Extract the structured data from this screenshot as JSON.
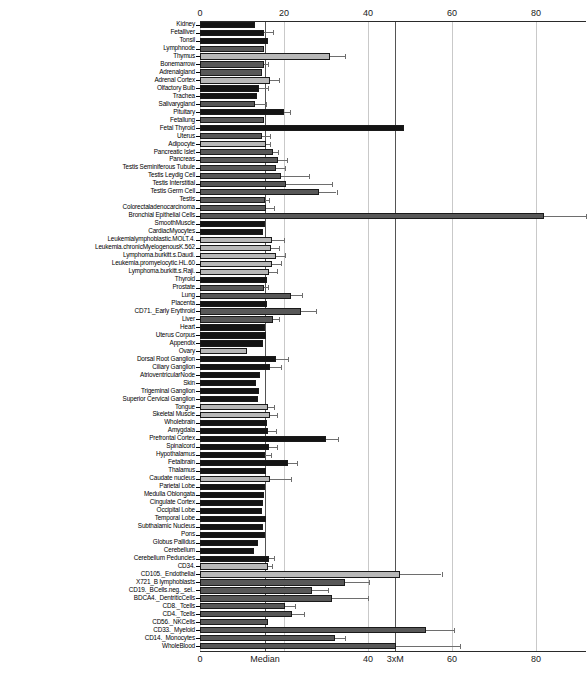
{
  "chart_data": {
    "type": "bar",
    "title": "",
    "subtitle": "",
    "xlabel": "",
    "ylabel": "",
    "orientation": "horizontal",
    "xlim": [
      0,
      90
    ],
    "grid": true,
    "legend": null,
    "axis_ticks_top": [
      {
        "label": "0",
        "value": 0
      },
      {
        "label": "20",
        "value": 20
      },
      {
        "label": "40",
        "value": 40
      },
      {
        "label": "60",
        "value": 60
      },
      {
        "label": "80",
        "value": 80
      }
    ],
    "axis_ticks_bottom": [
      {
        "label": "0",
        "value": 0
      },
      {
        "label": "Median",
        "value": 15.5
      },
      {
        "label": "40",
        "value": 40
      },
      {
        "label": "3xM",
        "value": 46.5
      },
      {
        "label": "60",
        "value": 60
      },
      {
        "label": "80",
        "value": 80
      }
    ],
    "reference_lines": [
      {
        "label": "Median",
        "value": 15.5
      },
      {
        "label": "3xM",
        "value": 46.5
      }
    ],
    "categories": [
      "Kidney",
      "Fetalliver",
      "Tonsil",
      "Lymphnode",
      "Thymus",
      "Bonemarrow",
      "Adrenalgland",
      "Adrenal Cortex",
      "Olfactory Bulb",
      "Trachea",
      "Salivarygland",
      "Pituitary",
      "Fetallung",
      "Fetal Thyroid",
      "Uterus",
      "Adipocyte",
      "Pancreatic Islet",
      "Pancreas",
      "Testis Seminiferous Tubule",
      "Testis Leydig Cell",
      "Testis Interstitial",
      "Testis Germ Cell",
      "Testis",
      "Colorectaladenocarcinoma",
      "Bronchial Epithelial Cells",
      "SmoothMuscle",
      "CardiacMyocytes",
      "Leukemialymphoblastic.MOLT.4.",
      "Leukemia.chronicMyelogenousK.562",
      "Lymphoma.burkitt.s.Daudi.",
      "Leukemia.promyelocytic.HL.60",
      "Lymphoma.burkitt.s.Raji.",
      "Thyroid",
      "Prostate",
      "Lung",
      "Placenta",
      "CD71._Early Erythroid",
      "Liver",
      "Heart",
      "Uterus Corpus",
      "Appendix",
      "Ovary",
      "Dorsal Root Ganglion",
      "Ciliary Ganglion",
      "AtrioventricularNode",
      "Skin",
      "Trigeminal Ganglion",
      "Superior Cervical Ganglion",
      "Tongue",
      "Skeletal Muscle",
      "Wholebrain",
      "Amygdala",
      "Prefrontal Cortex",
      "Spinalcord",
      "Hypothalamus",
      "Fetalbrain",
      "Thalamus",
      "Caudate nucleus",
      "Parietal Lobe",
      "Medulla Oblongata",
      "Cingulate Cortex",
      "Occipital Lobe",
      "Temporal Lobe",
      "Subthalamic Nucleus",
      "Pons",
      "Globus Pallidus",
      "Cerebellum",
      "Cerebellum Peduncles",
      "CD34.",
      "CD105._Endothelial",
      "X721_B lymphoblasts",
      "CD19._BCells.neg._sel..",
      "BDCA4._DentriticCells",
      "CD8._Tcells",
      "CD4._Tcells",
      "CD56._NKCells",
      "CD33._Myeloid",
      "CD14._Monocytes",
      "WholeBlood"
    ],
    "values": [
      13.2,
      15.3,
      16.3,
      15.2,
      31.0,
      15.2,
      14.8,
      16.6,
      14.1,
      13.6,
      13.0,
      19.9,
      15.2,
      48.5,
      14.8,
      15.6,
      17.3,
      18.6,
      18.1,
      19.4,
      20.5,
      28.4,
      15.5,
      15.6,
      82.0,
      15.5,
      14.9,
      17.2,
      16.9,
      18.2,
      17.2,
      16.4,
      16.0,
      15.2,
      21.7,
      16.0,
      24.0,
      17.4,
      15.4,
      15.6,
      15.0,
      11.2,
      18.0,
      16.7,
      14.3,
      13.3,
      14.0,
      13.8,
      16.2,
      16.6,
      16.0,
      16.2,
      29.9,
      16.4,
      15.4,
      20.9,
      15.8,
      16.6,
      15.4,
      15.3,
      15.0,
      14.7,
      15.6,
      14.9,
      15.4,
      13.9,
      12.8,
      16.4,
      16.1,
      47.6,
      34.6,
      26.6,
      31.4,
      20.3,
      21.9,
      16.1,
      53.8,
      32.2,
      46.6
    ],
    "errors_upper": [
      0.0,
      17.3,
      0.0,
      0.0,
      34.5,
      16.3,
      0.0,
      18.8,
      16.3,
      0.0,
      15.6,
      21.5,
      0.0,
      0.0,
      16.6,
      16.6,
      18.6,
      20.6,
      20.3,
      26.0,
      31.5,
      32.5,
      16.4,
      17.6,
      92.0,
      0.0,
      0.0,
      19.9,
      18.8,
      20.3,
      19.4,
      18.4,
      0.0,
      16.3,
      24.2,
      0.0,
      27.7,
      18.8,
      0.0,
      0.0,
      0.0,
      0.0,
      21.0,
      19.4,
      0.0,
      0.0,
      0.0,
      0.0,
      17.6,
      18.4,
      0.0,
      18.2,
      32.8,
      18.4,
      16.8,
      23.2,
      0.0,
      21.7,
      0.0,
      0.0,
      0.0,
      0.0,
      0.0,
      0.0,
      0.0,
      0.0,
      0.0,
      17.6,
      17.1,
      57.5,
      40.3,
      30.4,
      39.9,
      22.6,
      24.8,
      0.0,
      60.4,
      34.5,
      62.0
    ],
    "bar_shades": [
      "dark",
      "dark",
      "dark",
      "mid",
      "light",
      "mid",
      "mid",
      "light",
      "dark",
      "dark",
      "mid",
      "dark",
      "mid",
      "dark",
      "mid",
      "light",
      "mid",
      "mid",
      "mid",
      "mid",
      "mid",
      "mid",
      "mid",
      "mid",
      "mid",
      "dark",
      "dark",
      "light",
      "light",
      "light",
      "light",
      "light",
      "dark",
      "mid",
      "mid",
      "dark",
      "mid",
      "mid",
      "dark",
      "dark",
      "dark",
      "light",
      "dark",
      "dark",
      "dark",
      "dark",
      "dark",
      "dark",
      "light",
      "light",
      "dark",
      "dark",
      "dark",
      "dark",
      "dark",
      "dark",
      "dark",
      "light",
      "dark",
      "dark",
      "dark",
      "dark",
      "dark",
      "dark",
      "dark",
      "dark",
      "dark",
      "dark",
      "light",
      "light",
      "mid",
      "mid",
      "mid",
      "mid",
      "mid",
      "mid",
      "mid",
      "mid",
      "mid"
    ],
    "colors": {
      "dark": "#141414",
      "mid": "#585858",
      "light": "#b8b8b8",
      "error": "#6e6e6e",
      "grid": "#c9c9c9",
      "grid_strong": "#555555",
      "axis": "#2a2a2a"
    }
  },
  "caption": ""
}
